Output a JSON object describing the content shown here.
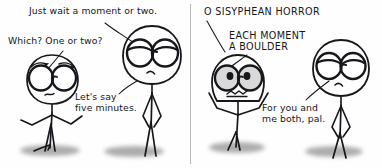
{
  "comic": {
    "title": "O Sisyphean Horror",
    "width": 382,
    "height": 168,
    "ink_color": "#17161a",
    "background_color": "#fefefe",
    "divider_color": "#b9b9b9",
    "shadow_color": "#8e8e8e",
    "panels": [
      {
        "name": "panel-left",
        "captions": [
          {
            "name": "caption-just-wait",
            "text": "Just wait a moment or two.",
            "style": "hand"
          },
          {
            "name": "caption-which-one-or-two",
            "text": "Which? One or two?",
            "style": "hand"
          },
          {
            "name": "caption-lets-say-five-minutes",
            "text": "Let's say\nfive minutes.",
            "style": "hand"
          }
        ],
        "characters": [
          {
            "name": "character-left-bespectacled",
            "expression": "worried",
            "pose": "arms-out"
          },
          {
            "name": "character-right-bespectacled",
            "expression": "frowning",
            "pose": "arms-down"
          }
        ]
      },
      {
        "name": "panel-right",
        "captions": [
          {
            "name": "caption-o-sisyphean-horror",
            "text": "O SISYPHEAN HORROR",
            "style": "caps"
          },
          {
            "name": "caption-each-moment-a-boulder",
            "text": "EACH MOMENT\nA BOULDER",
            "style": "caps"
          },
          {
            "name": "caption-for-you-and-me-both-pal",
            "text": "For you and\nme both, pal.",
            "style": "hand"
          }
        ],
        "characters": [
          {
            "name": "character-anguished-screamer",
            "expression": "anguished",
            "pose": "arms-raised"
          },
          {
            "name": "character-deadpan-companion",
            "expression": "frowning",
            "pose": "arms-down"
          }
        ]
      }
    ]
  }
}
